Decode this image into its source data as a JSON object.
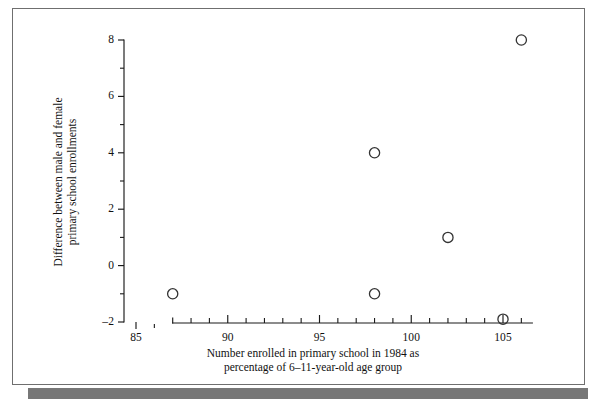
{
  "figure": {
    "frame_color": "#6f6f6f",
    "shadow_color": "#777777",
    "background_color": "#ffffff"
  },
  "chart_data": {
    "type": "scatter",
    "title": "",
    "xlabel_line1": "Number enrolled in primary school in 1984 as",
    "xlabel_line2": "percentage of  6–11-year-old age group",
    "ylabel_line1": "Difference between male and female",
    "ylabel_line2": "primary school enrollments",
    "xlim": [
      85,
      106.6
    ],
    "ylim": [
      -2,
      8
    ],
    "grid": false,
    "legend": false,
    "marker": "open-circle",
    "marker_color": "#333333",
    "x_axis_broken": true,
    "x_axis_break_note": "isolated ticks at 85 and 86, main spine starts at 87",
    "x_spine_start": 87,
    "x_spine_end": 106.6,
    "xticks_major": [
      85,
      90,
      95,
      100,
      105
    ],
    "xticks_major_labels": [
      "85",
      "90",
      "95",
      "100",
      "105"
    ],
    "xticks_minor": [
      86,
      87,
      88,
      89,
      91,
      92,
      93,
      94,
      96,
      97,
      98,
      99,
      101,
      102,
      103,
      104,
      106
    ],
    "yticks_major": [
      -2,
      0,
      2,
      4,
      6,
      8
    ],
    "yticks_major_labels": [
      "–2",
      "0",
      "2",
      "4",
      "6",
      "8"
    ],
    "yticks_minor": [
      -1,
      1,
      3,
      5,
      7
    ],
    "points": [
      {
        "x": 87,
        "y": -1
      },
      {
        "x": 98,
        "y": 4
      },
      {
        "x": 98,
        "y": -1
      },
      {
        "x": 102,
        "y": 1
      },
      {
        "x": 105,
        "y": -1.9
      },
      {
        "x": 106,
        "y": 8
      }
    ]
  }
}
